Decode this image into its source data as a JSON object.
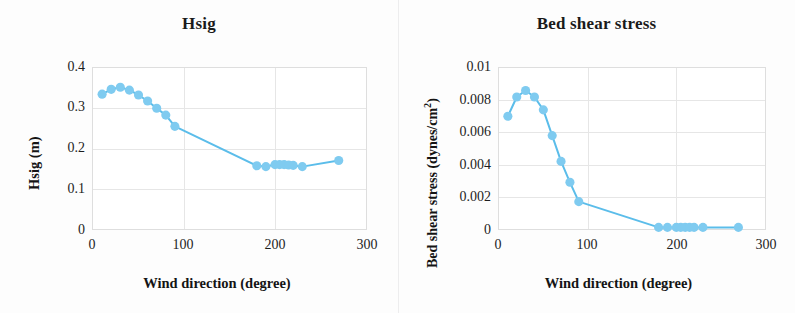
{
  "figure": {
    "background": "#fdfdfd",
    "accent_color": "#6CC4EE",
    "line_color": "#5BBDEA",
    "marker_color": "#7FCBF0",
    "grid_color": "#e6e6e6",
    "separator_color": "#ededee"
  },
  "panels": [
    {
      "key": "hsig",
      "title": "Hsig",
      "ylabel": "Hsig (m)",
      "xlabel": "Wind direction (degree)",
      "yticks": [
        "0.4",
        "0.3",
        "0.2",
        "0.1",
        "0"
      ],
      "xticks": [
        "0",
        "100",
        "200",
        "300"
      ]
    },
    {
      "key": "bed_shear_stress",
      "title": "Bed shear stress",
      "ylabel_main": "Bed shear stress (dynes/cm",
      "ylabel_sup": "2",
      "ylabel_tail": ")",
      "ylabel": "Bed shear stress (dynes/cm2)",
      "xlabel": "Wind direction (degree)",
      "yticks": [
        "0.01",
        "0.008",
        "0.006",
        "0.004",
        "0.002",
        "0"
      ],
      "xticks": [
        "0",
        "100",
        "200",
        "300"
      ]
    }
  ],
  "chart_data": [
    {
      "type": "line",
      "title": "Hsig",
      "xlabel": "Wind direction (degree)",
      "ylabel": "Hsig (m)",
      "xlim": [
        0,
        300
      ],
      "ylim": [
        0,
        0.4
      ],
      "xticks": [
        0,
        100,
        200,
        300
      ],
      "yticks": [
        0,
        0.1,
        0.2,
        0.3,
        0.4
      ],
      "grid": true,
      "legend": null,
      "markers": "circle",
      "series": [
        {
          "name": "Hsig",
          "x": [
            10,
            20,
            30,
            40,
            50,
            60,
            70,
            80,
            90,
            180,
            190,
            200,
            205,
            210,
            215,
            220,
            230,
            270
          ],
          "values": [
            0.335,
            0.347,
            0.352,
            0.345,
            0.333,
            0.318,
            0.3,
            0.283,
            0.255,
            0.157,
            0.155,
            0.16,
            0.16,
            0.16,
            0.159,
            0.158,
            0.155,
            0.17
          ]
        }
      ]
    },
    {
      "type": "line",
      "title": "Bed shear stress",
      "xlabel": "Wind direction (degree)",
      "ylabel": "Bed shear stress (dynes/cm2)",
      "xlim": [
        0,
        300
      ],
      "ylim": [
        0,
        0.01
      ],
      "xticks": [
        0,
        100,
        200,
        300
      ],
      "yticks": [
        0,
        0.002,
        0.004,
        0.006,
        0.008,
        0.01
      ],
      "grid": true,
      "legend": null,
      "markers": "circle",
      "series": [
        {
          "name": "Bed shear stress",
          "x": [
            10,
            20,
            30,
            40,
            50,
            60,
            70,
            80,
            90,
            180,
            190,
            200,
            205,
            210,
            215,
            220,
            230,
            270
          ],
          "values": [
            0.007,
            0.0082,
            0.0086,
            0.0082,
            0.0074,
            0.0058,
            0.0042,
            0.0029,
            0.0017,
            0.0001,
            0.0001,
            0.0001,
            0.0001,
            0.0001,
            0.0001,
            0.0001,
            0.0001,
            0.0001
          ]
        }
      ]
    }
  ]
}
